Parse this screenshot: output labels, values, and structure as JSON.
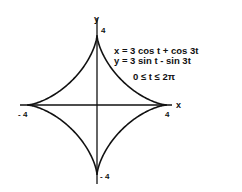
{
  "chart_data": {
    "type": "line",
    "title": "",
    "curve_name": "astroid",
    "parametric": {
      "x_expr": "x = 3 cos t + cos 3t",
      "y_expr": "y = 3 sin t - sin 3t",
      "domain": "0 ≤ t ≤ 2π",
      "t_range": [
        0,
        6.2832
      ]
    },
    "xlabel": "x",
    "ylabel": "y",
    "xlim": [
      -4,
      4
    ],
    "ylim": [
      -4,
      4
    ],
    "grid": false,
    "legend": "none",
    "tick_labels": {
      "x_neg": "- 4",
      "x_pos": "4",
      "y_pos": "4",
      "y_neg": "- 4"
    },
    "series": [
      {
        "name": "astroid",
        "points": [
          {
            "t": 0,
            "x": 4,
            "y": 0
          },
          {
            "t": 0.7854,
            "x": 1.414,
            "y": 1.414
          },
          {
            "t": 1.5708,
            "x": 0,
            "y": 4
          },
          {
            "t": 2.3562,
            "x": -1.414,
            "y": 1.414
          },
          {
            "t": 3.1416,
            "x": -4,
            "y": 0
          },
          {
            "t": 3.927,
            "x": -1.414,
            "y": -1.414
          },
          {
            "t": 4.7124,
            "x": 0,
            "y": -4
          },
          {
            "t": 5.4978,
            "x": 1.414,
            "y": -1.414
          },
          {
            "t": 6.2832,
            "x": 4,
            "y": 0
          }
        ]
      }
    ]
  },
  "labels": {
    "eq_x": "x = 3 cos t + cos 3t",
    "eq_y": "y = 3 sin t - sin 3t",
    "eq_domain": "0 ≤ t ≤ 2π",
    "axis_x": "x",
    "axis_y": "y",
    "tick_x_neg": "- 4",
    "tick_x_pos": "4",
    "tick_y_pos": "4",
    "tick_y_neg": "- 4"
  }
}
